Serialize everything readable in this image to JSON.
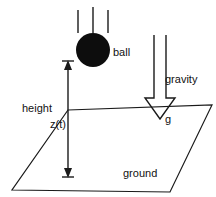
{
  "diagram": {
    "kind": "physics-free-body-diagram",
    "colors": {
      "stroke": "#1a1a1a",
      "ball_fill": "#0d0d0d",
      "background": "#ffffff",
      "arrow_fill": "#ffffff"
    },
    "labels": {
      "ball": "ball",
      "gravity": "gravity",
      "g": "g",
      "height": "height",
      "z_of_t": "z(t)",
      "ground": "ground"
    },
    "geometry": {
      "ball": {
        "cx": 93,
        "cy": 50,
        "r": 17
      },
      "motion_lines": [
        {
          "x": 78,
          "y1": 10,
          "y2": 33
        },
        {
          "x": 93,
          "y1": 7,
          "y2": 33
        },
        {
          "x": 108,
          "y1": 10,
          "y2": 33
        }
      ],
      "gravity_arrow": {
        "cx": 160,
        "shaft_top": 35,
        "shaft_half_width": 6,
        "head_top": 98,
        "head_half_width": 15,
        "tip_y": 119
      },
      "ground_plane": {
        "points": "68,110 212,105 170,192 12,190"
      },
      "height_dimension": {
        "x": 68,
        "y_top": 62,
        "y_bottom": 176
      }
    },
    "label_positions": {
      "ball": {
        "x": 113,
        "y": 56
      },
      "gravity": {
        "x": 165,
        "y": 83
      },
      "g": {
        "x": 165,
        "y": 123
      },
      "height": {
        "x": 22,
        "y": 112
      },
      "z_of_t": {
        "x": 50,
        "y": 128
      },
      "ground": {
        "x": 123,
        "y": 177
      }
    }
  }
}
